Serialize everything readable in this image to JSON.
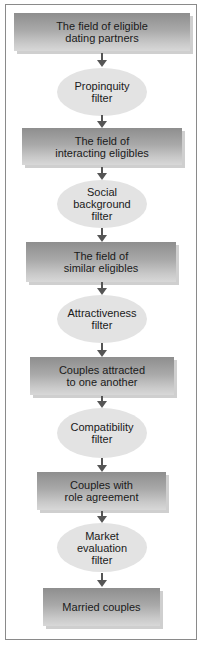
{
  "diagram": {
    "title": "",
    "colors": {
      "box_gradient_top": "#8e8e8e",
      "box_gradient_bottom": "#d8d8d8",
      "ellipse_fill": "#e3e3e3",
      "arrow": "#555555",
      "frame_border": "#8a8a8a"
    },
    "nodes": [
      {
        "type": "box",
        "label": "The field of eligible\ndating partners"
      },
      {
        "type": "filter",
        "label": "Propinquity\nfilter"
      },
      {
        "type": "box",
        "label": "The field of\ninteracting eligibles"
      },
      {
        "type": "filter",
        "label": "Social\nbackground\nfilter"
      },
      {
        "type": "box",
        "label": "The field of\nsimilar eligibles"
      },
      {
        "type": "filter",
        "label": "Attractiveness\nfilter"
      },
      {
        "type": "box",
        "label": "Couples attracted\nto one another"
      },
      {
        "type": "filter",
        "label": "Compatibility\nfilter"
      },
      {
        "type": "box",
        "label": "Couples with\nrole agreement"
      },
      {
        "type": "filter",
        "label": "Market\nevaluation\nfilter"
      },
      {
        "type": "box",
        "label": "Married couples"
      }
    ],
    "edges": [
      {
        "from": 0,
        "to": 1
      },
      {
        "from": 1,
        "to": 2
      },
      {
        "from": 2,
        "to": 3
      },
      {
        "from": 3,
        "to": 4
      },
      {
        "from": 4,
        "to": 5
      },
      {
        "from": 5,
        "to": 6
      },
      {
        "from": 6,
        "to": 7
      },
      {
        "from": 7,
        "to": 8
      },
      {
        "from": 8,
        "to": 9
      },
      {
        "from": 9,
        "to": 10
      }
    ]
  }
}
